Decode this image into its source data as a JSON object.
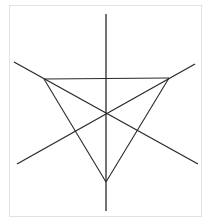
{
  "diagram": {
    "type": "geometry-figure",
    "colors": {
      "frame": "#e2e2e2",
      "stroke": "#2a2a2a",
      "background": "#ffffff"
    },
    "points": {
      "A": {
        "x": 44,
        "y": 79
      },
      "B": {
        "x": 169,
        "y": 78
      },
      "C": {
        "x": 106,
        "y": 182
      },
      "O": {
        "x": 106,
        "y": 114
      }
    },
    "triangle": [
      {
        "x1": 44,
        "y1": 79,
        "x2": 169,
        "y2": 78
      },
      {
        "x1": 169,
        "y1": 78,
        "x2": 106,
        "y2": 182
      },
      {
        "x1": 106,
        "y1": 182,
        "x2": 44,
        "y2": 79
      }
    ],
    "lines": [
      {
        "name": "vertical-axis-line",
        "x1": 106,
        "y1": 14,
        "x2": 106,
        "y2": 211
      },
      {
        "name": "descending-diagonal-line",
        "x1": 14,
        "y1": 62,
        "x2": 198,
        "y2": 164
      },
      {
        "name": "ascending-diagonal-line",
        "x1": 17,
        "y1": 164,
        "x2": 195,
        "y2": 64
      }
    ]
  }
}
